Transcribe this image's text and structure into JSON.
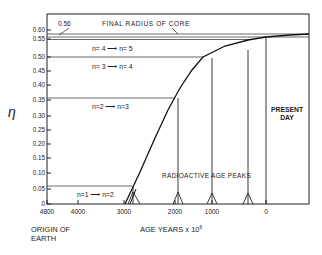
{
  "chart_data": {
    "type": "line",
    "title": "",
    "ylabel": "η",
    "xlabel": "AGE YEARS x 10^6",
    "xlabel_parts": {
      "main": "AGE YEARS x 10",
      "exp": "6"
    },
    "x_origin_label": [
      "ORIGIN OF",
      "EARTH"
    ],
    "xlim": [
      4800,
      -800
    ],
    "ylim": [
      0,
      0.62
    ],
    "x_ticks": [
      {
        "value": 4800,
        "label": "4800"
      },
      {
        "value": 4000,
        "label": "4000"
      },
      {
        "value": 3000,
        "label": "3000"
      },
      {
        "value": 2000,
        "label": "2000"
      },
      {
        "value": 1000,
        "label": "1000"
      },
      {
        "value": 0,
        "label": "0"
      }
    ],
    "y_ticks": [
      {
        "value": 0,
        "label": "0"
      },
      {
        "value": 0.05,
        "label": "0.05"
      },
      {
        "value": 0.1,
        "label": "0.10"
      },
      {
        "value": 0.15,
        "label": "0.15"
      },
      {
        "value": 0.2,
        "label": "0.20"
      },
      {
        "value": 0.25,
        "label": "0.25"
      },
      {
        "value": 0.3,
        "label": "0.30"
      },
      {
        "value": 0.35,
        "label": "0.35"
      },
      {
        "value": 0.4,
        "label": "0.40"
      },
      {
        "value": 0.45,
        "label": "0.45"
      },
      {
        "value": 0.5,
        "label": "0.50"
      },
      {
        "value": 0.55,
        "label": "0.55"
      },
      {
        "value": 0.6,
        "label": "0.60"
      }
    ],
    "series": [
      {
        "name": "core radius growth",
        "x": [
          2900,
          2600,
          2300,
          2000,
          1700,
          1400,
          1100,
          800,
          500,
          200,
          0,
          -400,
          -800
        ],
        "y": [
          0,
          0.1,
          0.2,
          0.29,
          0.37,
          0.44,
          0.49,
          0.52,
          0.545,
          0.56,
          0.565,
          0.572,
          0.575
        ]
      }
    ],
    "horizontal_levels": [
      {
        "value": 0.06,
        "label": "n=1 → n=2"
      },
      {
        "value": 0.36,
        "label": "n=2 → n=3"
      },
      {
        "value": 0.49,
        "label": "n= 3 → n= 4"
      },
      {
        "value": 0.545,
        "label": "n= 4 → n= 5"
      },
      {
        "value": 0.56,
        "label": "FINAL RADIUS OF CORE"
      }
    ],
    "annotations": [
      {
        "text": "0.56",
        "target": "final radius line"
      },
      {
        "text": "FINAL RADIUS OF CORE"
      },
      {
        "text": "RADIOACTIVE AGE PEAKS"
      },
      {
        "text": "PRESENT DAY"
      }
    ],
    "age_peaks": [
      2700,
      1800,
      1000,
      300
    ],
    "present_day": 0,
    "legend": null,
    "grid": false
  },
  "labels": {
    "eta": "η",
    "final_value": "0.56",
    "final_radius": "FINAL RADIUS OF CORE",
    "n45": "n= 4 ⟶ n= 5",
    "n34": "n= 3 ⟶ n= 4",
    "n23": "n=2 ⟶ n=3",
    "n12": "n=1 ⟶ n=2",
    "peaks": "RADIOACTIVE AGE PEAKS",
    "present1": "PRESENT",
    "present2": "DAY",
    "origin1": "ORIGIN OF",
    "origin2": "EARTH",
    "xlabel": "AGE YEARS x 10",
    "xexp": "6"
  }
}
